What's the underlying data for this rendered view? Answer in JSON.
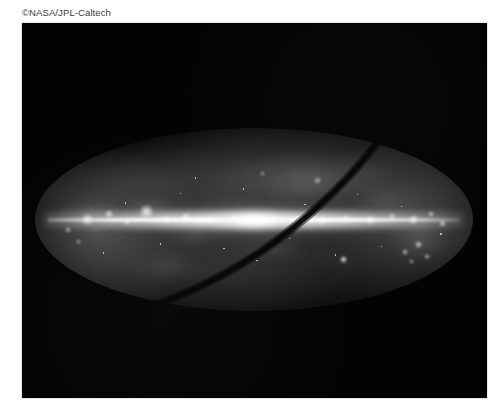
{
  "page": {
    "background_color": "#ffffff",
    "width": 500,
    "height": 416
  },
  "credit": {
    "text": "©NASA/JPL-Caltech",
    "color": "#3a3a3a"
  },
  "figure": {
    "name": "all-sky-infrared-map",
    "plate_color": "#030303",
    "projection": "Mollweide all-sky oval",
    "features": {
      "galactic_plane_label": "galactic plane",
      "galactic_center_label": "galactic center bulge",
      "ecliptic_arc_label": "dark ecliptic scan arc",
      "bright_source_label": "isolated bright source"
    }
  },
  "chart_data": {
    "type": "heatmap",
    "title": "",
    "xlabel": "",
    "ylabel": "",
    "projection": "mollweide",
    "grid": false,
    "legend": null,
    "colormap": "grayscale",
    "oval": {
      "cx": 0.5,
      "cy": 0.5,
      "rx": 0.47,
      "ry": 0.245
    },
    "bright_knots": [
      {
        "x": 0.12,
        "y": 0.5,
        "r": 5.5,
        "i": 0.85
      },
      {
        "x": 0.17,
        "y": 0.47,
        "r": 4.0,
        "i": 0.8
      },
      {
        "x": 0.21,
        "y": 0.51,
        "r": 3.2,
        "i": 0.7
      },
      {
        "x": 0.255,
        "y": 0.455,
        "r": 6.5,
        "i": 0.95
      },
      {
        "x": 0.3,
        "y": 0.5,
        "r": 3.4,
        "i": 0.75
      },
      {
        "x": 0.345,
        "y": 0.49,
        "r": 4.2,
        "i": 0.82
      },
      {
        "x": 0.4,
        "y": 0.505,
        "r": 3.0,
        "i": 0.7
      },
      {
        "x": 0.455,
        "y": 0.495,
        "r": 3.6,
        "i": 0.78
      },
      {
        "x": 0.545,
        "y": 0.5,
        "r": 3.4,
        "i": 0.76
      },
      {
        "x": 0.6,
        "y": 0.49,
        "r": 3.0,
        "i": 0.72
      },
      {
        "x": 0.655,
        "y": 0.505,
        "r": 3.8,
        "i": 0.8
      },
      {
        "x": 0.71,
        "y": 0.495,
        "r": 3.2,
        "i": 0.74
      },
      {
        "x": 0.765,
        "y": 0.5,
        "r": 4.0,
        "i": 0.82
      },
      {
        "x": 0.815,
        "y": 0.485,
        "r": 3.4,
        "i": 0.76
      },
      {
        "x": 0.865,
        "y": 0.5,
        "r": 4.4,
        "i": 0.84
      },
      {
        "x": 0.905,
        "y": 0.47,
        "r": 3.0,
        "i": 0.7
      },
      {
        "x": 0.93,
        "y": 0.52,
        "r": 3.4,
        "i": 0.72
      },
      {
        "x": 0.875,
        "y": 0.635,
        "r": 3.6,
        "i": 0.8
      },
      {
        "x": 0.845,
        "y": 0.68,
        "r": 3.0,
        "i": 0.74
      },
      {
        "x": 0.895,
        "y": 0.7,
        "r": 2.6,
        "i": 0.68
      },
      {
        "x": 0.86,
        "y": 0.73,
        "r": 2.4,
        "i": 0.64
      },
      {
        "x": 0.075,
        "y": 0.555,
        "r": 3.0,
        "i": 0.66
      },
      {
        "x": 0.1,
        "y": 0.62,
        "r": 2.6,
        "i": 0.6
      },
      {
        "x": 0.645,
        "y": 0.285,
        "r": 3.4,
        "i": 0.62
      },
      {
        "x": 0.52,
        "y": 0.25,
        "r": 2.4,
        "i": 0.52
      }
    ],
    "diffuse_clouds": [
      {
        "x": 0.13,
        "y": 0.47,
        "rx": 34,
        "ry": 14,
        "i": 0.4
      },
      {
        "x": 0.26,
        "y": 0.45,
        "rx": 28,
        "ry": 13,
        "i": 0.44
      },
      {
        "x": 0.37,
        "y": 0.58,
        "rx": 30,
        "ry": 15,
        "i": 0.3
      },
      {
        "x": 0.62,
        "y": 0.33,
        "rx": 44,
        "ry": 20,
        "i": 0.28
      },
      {
        "x": 0.8,
        "y": 0.4,
        "rx": 36,
        "ry": 18,
        "i": 0.26
      },
      {
        "x": 0.88,
        "y": 0.62,
        "rx": 30,
        "ry": 20,
        "i": 0.3
      },
      {
        "x": 0.3,
        "y": 0.76,
        "rx": 40,
        "ry": 16,
        "i": 0.2
      },
      {
        "x": 0.55,
        "y": 0.66,
        "rx": 34,
        "ry": 14,
        "i": 0.18
      }
    ],
    "point_sources": [
      {
        "x": 0.205,
        "y": 0.405
      },
      {
        "x": 0.285,
        "y": 0.63
      },
      {
        "x": 0.33,
        "y": 0.355
      },
      {
        "x": 0.43,
        "y": 0.655
      },
      {
        "x": 0.475,
        "y": 0.33
      },
      {
        "x": 0.58,
        "y": 0.6
      },
      {
        "x": 0.615,
        "y": 0.415
      },
      {
        "x": 0.685,
        "y": 0.69
      },
      {
        "x": 0.735,
        "y": 0.36
      },
      {
        "x": 0.79,
        "y": 0.645
      },
      {
        "x": 0.835,
        "y": 0.425
      },
      {
        "x": 0.155,
        "y": 0.68
      },
      {
        "x": 0.505,
        "y": 0.72
      },
      {
        "x": 0.365,
        "y": 0.27
      },
      {
        "x": 0.925,
        "y": 0.575
      }
    ],
    "ecliptic_arc_path": "M 352 0 C 330 34, 300 66, 258 100 C 214 136, 160 164, 104 183"
  }
}
